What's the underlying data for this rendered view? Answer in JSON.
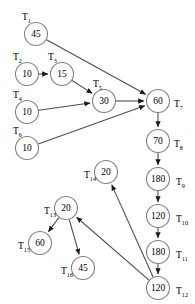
{
  "diagram": {
    "node_stroke_color": "#808080",
    "edge_color": "#4d4d4d",
    "background_color": "#ffffff",
    "nodes": [
      {
        "id": "T1",
        "label_base": "T",
        "label_sub": "1",
        "value": "45",
        "cx": 36,
        "cy": 34,
        "label_x": 22,
        "label_y": 17,
        "label_side": "above-left"
      },
      {
        "id": "T2",
        "label_base": "T",
        "label_sub": "2",
        "value": "10",
        "cx": 27,
        "cy": 74,
        "label_x": 13,
        "label_y": 57,
        "label_side": "above-left"
      },
      {
        "id": "T3",
        "label_base": "T",
        "label_sub": "3",
        "value": "15",
        "cx": 62,
        "cy": 74,
        "label_x": 48,
        "label_y": 57,
        "label_side": "above-left"
      },
      {
        "id": "T4",
        "label_base": "T",
        "label_sub": "4",
        "value": "10",
        "cx": 27,
        "cy": 112,
        "label_x": 13,
        "label_y": 95,
        "label_side": "above-left"
      },
      {
        "id": "T5",
        "label_base": "T",
        "label_sub": "5",
        "value": "30",
        "cx": 104,
        "cy": 101,
        "label_x": 93,
        "label_y": 84,
        "label_side": "above-left"
      },
      {
        "id": "T6",
        "label_base": "T",
        "label_sub": "6",
        "value": "10",
        "cx": 27,
        "cy": 148,
        "label_x": 13,
        "label_y": 131,
        "label_side": "above-left"
      },
      {
        "id": "T7",
        "label_base": "T",
        "label_sub": "7",
        "value": "60",
        "cx": 158,
        "cy": 101,
        "label_x": 174,
        "label_y": 104,
        "label_side": "right"
      },
      {
        "id": "T8",
        "label_base": "T",
        "label_sub": "8",
        "value": "70",
        "cx": 158,
        "cy": 141,
        "label_x": 174,
        "label_y": 144,
        "label_side": "right"
      },
      {
        "id": "T9",
        "label_base": "T",
        "label_sub": "9",
        "value": "180",
        "cx": 158,
        "cy": 179,
        "label_x": 176,
        "label_y": 182,
        "label_side": "right"
      },
      {
        "id": "T10",
        "label_base": "T",
        "label_sub": "10",
        "value": "120",
        "cx": 158,
        "cy": 216,
        "label_x": 176,
        "label_y": 219,
        "label_side": "right"
      },
      {
        "id": "T11",
        "label_base": "T",
        "label_sub": "11",
        "value": "180",
        "cx": 158,
        "cy": 252,
        "label_x": 176,
        "label_y": 255,
        "label_side": "right"
      },
      {
        "id": "T12",
        "label_base": "T",
        "label_sub": "12",
        "value": "120",
        "cx": 158,
        "cy": 288,
        "label_x": 176,
        "label_y": 291,
        "label_side": "right"
      },
      {
        "id": "T13",
        "label_base": "T",
        "label_sub": "13",
        "value": "20",
        "cx": 66,
        "cy": 208,
        "label_x": 44,
        "label_y": 211,
        "label_side": "left"
      },
      {
        "id": "T14",
        "label_base": "T",
        "label_sub": "14",
        "value": "20",
        "cx": 106,
        "cy": 172,
        "label_x": 84,
        "label_y": 175,
        "label_side": "left"
      },
      {
        "id": "T15",
        "label_base": "T",
        "label_sub": "15",
        "value": "60",
        "cx": 40,
        "cy": 243,
        "label_x": 18,
        "label_y": 246,
        "label_side": "left"
      },
      {
        "id": "T16",
        "label_base": "T",
        "label_sub": "16",
        "value": "45",
        "cx": 83,
        "cy": 268,
        "label_x": 61,
        "label_y": 271,
        "label_side": "left"
      }
    ],
    "edges": [
      {
        "from": "T1",
        "to": "T7"
      },
      {
        "from": "T2",
        "to": "T3"
      },
      {
        "from": "T3",
        "to": "T5"
      },
      {
        "from": "T4",
        "to": "T5"
      },
      {
        "from": "T5",
        "to": "T7"
      },
      {
        "from": "T6",
        "to": "T7"
      },
      {
        "from": "T7",
        "to": "T8"
      },
      {
        "from": "T8",
        "to": "T9"
      },
      {
        "from": "T9",
        "to": "T10"
      },
      {
        "from": "T10",
        "to": "T11"
      },
      {
        "from": "T11",
        "to": "T12"
      },
      {
        "from": "T12",
        "to": "T14"
      },
      {
        "from": "T12",
        "to": "T13"
      },
      {
        "from": "T13",
        "to": "T15"
      },
      {
        "from": "T13",
        "to": "T16"
      }
    ]
  }
}
